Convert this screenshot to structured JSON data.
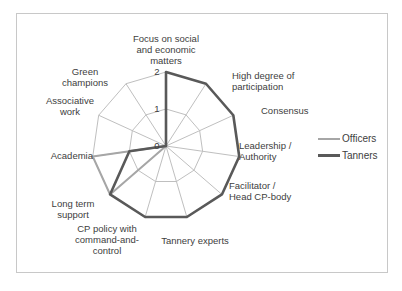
{
  "page": {
    "top_text": "...pporting ... ... ... ... ... ...phy ... ...p..."
  },
  "chart_data": {
    "type": "radar",
    "title": "",
    "categories": [
      "Focus on social and economic matters",
      "High degree of participation",
      "Consensus",
      "Leadership / Authority",
      "Facilitator / Head CP-body",
      "Tannery experts",
      "CP policy with command-and-control",
      "Long term support",
      "Academia",
      "Associative work",
      "Green champions"
    ],
    "series": [
      {
        "name": "Officers",
        "color": "#a6a6a6",
        "values": [
          0,
          0,
          0,
          0,
          0,
          0,
          0,
          2,
          2,
          0,
          0
        ]
      },
      {
        "name": "Tanners",
        "color": "#595959",
        "values": [
          2,
          2,
          2,
          2,
          2,
          2,
          2,
          2,
          1,
          0,
          0
        ]
      }
    ],
    "radial_ticks": [
      "0",
      "1",
      "2"
    ],
    "rlim": [
      0,
      2
    ],
    "grid": true,
    "legend_position": "right"
  },
  "legend": {
    "items": [
      {
        "label": "Officers",
        "color": "#a6a6a6"
      },
      {
        "label": "Tanners",
        "color": "#595959"
      }
    ]
  }
}
